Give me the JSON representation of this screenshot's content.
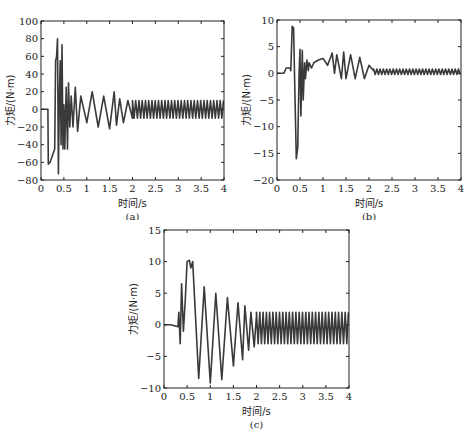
{
  "chart_data": [
    {
      "id": "a",
      "type": "line",
      "caption": "(a)",
      "xlabel": "时间/s",
      "ylabel": "力矩/(N·m)",
      "xlim": [
        0,
        4
      ],
      "ylim": [
        -80,
        100
      ],
      "xticks": [
        0,
        0.5,
        1,
        1.5,
        2,
        2.5,
        3,
        3.5,
        4
      ],
      "xtick_labels": [
        "0",
        "0.5",
        "1",
        "1.5",
        "2",
        "2.5",
        "3",
        "3.5",
        "4"
      ],
      "yticks": [
        -80,
        -60,
        -40,
        -20,
        0,
        20,
        40,
        60,
        80,
        100
      ],
      "ytick_labels": [
        "−80",
        "−60",
        "−40",
        "−20",
        "0",
        "20",
        "40",
        "60",
        "80",
        "100"
      ],
      "grid": false,
      "color": "#3a3a3a",
      "x": [
        0,
        0.15,
        0.16,
        0.2,
        0.3,
        0.32,
        0.34,
        0.36,
        0.38,
        0.4,
        0.42,
        0.44,
        0.46,
        0.48,
        0.5,
        0.52,
        0.55,
        0.58,
        0.6,
        0.63,
        0.66,
        0.7,
        0.75,
        0.8,
        0.87,
        1.0,
        1.12,
        1.25,
        1.37,
        1.5,
        1.6,
        1.65,
        1.72,
        1.8,
        1.9,
        2.0,
        4.0
      ],
      "y": [
        0,
        0,
        -62,
        -60,
        -45,
        55,
        60,
        80,
        -73,
        10,
        55,
        -40,
        73,
        -45,
        5,
        -45,
        25,
        -45,
        30,
        -20,
        15,
        -20,
        25,
        -25,
        15,
        -15,
        20,
        -20,
        15,
        -22,
        20,
        -18,
        12,
        -15,
        10,
        -10,
        10
      ],
      "steady_state": {
        "from": 2.0,
        "to": 4.0,
        "amplitude": 10,
        "period": 0.071
      }
    },
    {
      "id": "b",
      "type": "line",
      "caption": "(b)",
      "xlabel": "时间/s",
      "ylabel": "力矩/(N·m)",
      "xlim": [
        0,
        4
      ],
      "ylim": [
        -20,
        10
      ],
      "xticks": [
        0,
        0.5,
        1,
        1.5,
        2,
        2.5,
        3,
        3.5,
        4
      ],
      "xtick_labels": [
        "0",
        "0.5",
        "1",
        "1.5",
        "2",
        "2.5",
        "3",
        "3.5",
        "4"
      ],
      "yticks": [
        -20,
        -15,
        -10,
        -5,
        0,
        5
      ],
      "ytick_labels": [
        "−20",
        "−15",
        "−10",
        "−5",
        "0",
        "5",
        "10"
      ],
      "ytick_all": [
        -20,
        -15,
        -10,
        -5,
        0,
        5,
        10
      ],
      "grid": false,
      "color": "#3a3a3a",
      "x": [
        0,
        0.15,
        0.2,
        0.28,
        0.3,
        0.33,
        0.36,
        0.38,
        0.42,
        0.45,
        0.48,
        0.5,
        0.52,
        0.55,
        0.57,
        0.6,
        0.62,
        0.65,
        0.68,
        0.7,
        0.75,
        0.8,
        0.9,
        1.0,
        1.1,
        1.2,
        1.25,
        1.3,
        1.4,
        1.45,
        1.5,
        1.6,
        1.7,
        1.8,
        1.9,
        2.0,
        2.1,
        2.2,
        4.0
      ],
      "y": [
        0,
        0,
        1,
        1,
        0.5,
        8.8,
        8.5,
        0,
        -16,
        -14,
        0,
        4.5,
        -8,
        4.3,
        -5,
        2,
        -1,
        2.5,
        0.5,
        2,
        1,
        2,
        2.5,
        2.8,
        1.5,
        3.8,
        0,
        3.5,
        -1,
        4,
        -1,
        3.5,
        -1,
        3,
        -1,
        1.5,
        0.5,
        0.3,
        0.3
      ],
      "steady_state": {
        "from": 2.1,
        "to": 4.0,
        "center": 0.3,
        "amplitude": 0.5,
        "period": 0.071
      }
    },
    {
      "id": "c",
      "type": "line",
      "caption": "(c)",
      "xlabel": "时间/s",
      "ylabel": "力矩/(N·m)",
      "xlim": [
        0,
        4
      ],
      "ylim": [
        -10,
        15
      ],
      "xticks": [
        0,
        0.5,
        1,
        1.5,
        2,
        2.5,
        3,
        3.5,
        4
      ],
      "xtick_labels": [
        "0",
        "0.5",
        "1",
        "1.5",
        "2",
        "2.5",
        "3",
        "3.5",
        "4"
      ],
      "yticks": [
        -10,
        -5,
        0,
        5,
        10,
        15
      ],
      "ytick_labels": [
        "−10",
        "−5",
        "0",
        "5",
        "10",
        "15"
      ],
      "grid": false,
      "color": "#3a3a3a",
      "x": [
        0,
        0.15,
        0.3,
        0.32,
        0.35,
        0.38,
        0.42,
        0.46,
        0.5,
        0.55,
        0.58,
        0.62,
        0.75,
        0.87,
        1.0,
        1.12,
        1.25,
        1.37,
        1.5,
        1.6,
        1.7,
        1.75,
        1.83,
        1.88,
        1.95,
        2.0
      ],
      "y": [
        0,
        0,
        -0.3,
        2,
        -3,
        6.5,
        -1,
        4,
        10,
        10.2,
        9,
        10,
        -8.5,
        6,
        -9.2,
        5,
        -8.7,
        4.3,
        -6.5,
        3.5,
        -5.5,
        3,
        -4,
        2,
        -3.5,
        1.5
      ],
      "steady_state": {
        "from": 2.0,
        "to": 4.0,
        "center": -0.5,
        "amplitude": 2.5,
        "period": 0.071
      }
    }
  ]
}
